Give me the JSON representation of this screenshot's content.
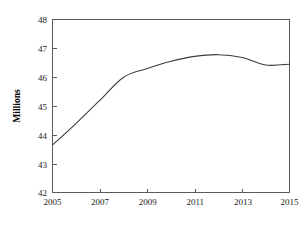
{
  "chart_data": {
    "type": "line",
    "title": "",
    "subtitle": "",
    "xlabel": "",
    "ylabel": "Millions",
    "x": [
      2005,
      2006,
      2007,
      2008,
      2009,
      2010,
      2011,
      2012,
      2013,
      2014,
      2015
    ],
    "series": [
      {
        "name": "Millions",
        "values": [
          43.65,
          44.4,
          45.2,
          46.0,
          46.3,
          46.55,
          46.72,
          46.78,
          46.68,
          46.42,
          46.45
        ],
        "color": "#3c3c3c"
      }
    ],
    "xlim": [
      2005,
      2015
    ],
    "ylim": [
      42,
      48
    ],
    "xticks": [
      2005,
      2007,
      2009,
      2011,
      2013,
      2015
    ],
    "xticklabels": [
      "2005",
      "2007",
      "2009",
      "2011",
      "2013",
      "2015"
    ],
    "yticks": [
      42,
      43,
      44,
      45,
      46,
      47,
      48
    ],
    "yticklabels": [
      "42",
      "43",
      "44",
      "45",
      "46",
      "47",
      "48"
    ],
    "grid": false,
    "legend": false,
    "legend_position": "none",
    "frame": "box",
    "marker": "none",
    "line_color": "#3c3c3c",
    "axis_color": "#5a5a5a",
    "background": "#ffffff"
  },
  "axes": {
    "y_title": "Millions",
    "y_ticks": [
      {
        "label": "48",
        "value": 48
      },
      {
        "label": "47",
        "value": 47
      },
      {
        "label": "46",
        "value": 46
      },
      {
        "label": "45",
        "value": 45
      },
      {
        "label": "44",
        "value": 44
      },
      {
        "label": "43",
        "value": 43
      },
      {
        "label": "42",
        "value": 42
      }
    ],
    "x_ticks": [
      {
        "label": "2005",
        "value": 2005
      },
      {
        "label": "2007",
        "value": 2007
      },
      {
        "label": "2009",
        "value": 2009
      },
      {
        "label": "2011",
        "value": 2011
      },
      {
        "label": "2013",
        "value": 2013
      },
      {
        "label": "2015",
        "value": 2015
      }
    ]
  }
}
